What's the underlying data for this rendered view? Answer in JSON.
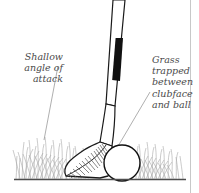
{
  "figure": {
    "background_color": "#ffffff"
  },
  "labels": {
    "left": {
      "text": "Shallow\nangle of\nattack",
      "name": "shallow-angle-of-attack-label",
      "color": "#4a4a4a"
    },
    "right": {
      "text": "Grass\ntrapped\nbetween\nclubface\nand ball",
      "name": "grass-trapped-label",
      "color": "#4a4a4a"
    }
  },
  "leader_lines": {
    "left": {
      "from": [
        58,
        66
      ],
      "to": [
        44,
        140
      ],
      "color": "#8c8c8c"
    },
    "right": {
      "from": [
        150,
        92
      ],
      "to": [
        104,
        170
      ],
      "color": "#8c8c8c"
    }
  },
  "elements": {
    "club_shaft": {
      "name": "club-shaft",
      "fill": "#ffffff",
      "stroke": "#1a1a1a"
    },
    "grip_band": {
      "name": "club-grip-band",
      "fill": "#111111"
    },
    "clubhead": {
      "name": "clubhead-iron",
      "fill": "#ffffff",
      "stroke": "#1a1a1a"
    },
    "clubface_grooves": {
      "name": "clubface-grooves",
      "stroke": "#555555",
      "count": 14
    },
    "golf_ball": {
      "name": "golf-ball",
      "fill": "#ffffff",
      "stroke": "#111111",
      "center": [
        122,
        163
      ],
      "radius": 18
    },
    "grass": {
      "name": "grass-blades",
      "color": "#9a9a9a",
      "count": 70
    },
    "ground_line": {
      "name": "ground-line",
      "color": "#4d4d4d",
      "y": 179
    },
    "right_border": {
      "name": "panel-right-border",
      "color": "#c8c8c8",
      "x": 190
    }
  }
}
